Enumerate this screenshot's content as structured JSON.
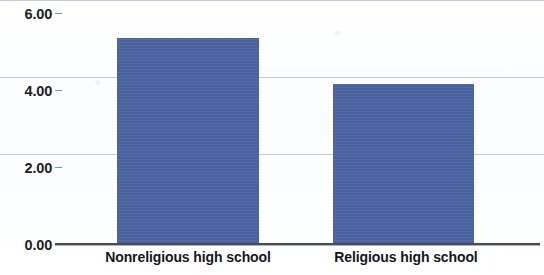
{
  "chart_data": {
    "type": "bar",
    "title": "",
    "subtitle": "",
    "xlabel": "",
    "ylabel": "",
    "categories": [
      "Nonreligious high school",
      "Religious high school"
    ],
    "values": [
      5.34,
      4.16
    ],
    "series": [
      {
        "name": "",
        "values": [
          5.34,
          4.16
        ]
      }
    ],
    "ylim": [
      0.0,
      6.0
    ],
    "yticks": [
      0.0,
      2.0,
      4.0,
      6.0
    ],
    "ytick_labels": [
      "0.00",
      "2.00",
      "4.00",
      "6.00"
    ],
    "grid": "horizontal",
    "legend": "none",
    "bar_color": "#4a63a0",
    "gridline_color": "#b9c4cf",
    "axis_color": "#4a4a52",
    "background_color": "#ffffff"
  },
  "axis": {
    "y": {
      "ticks": [
        {
          "label": "6.00",
          "value": 6.0
        },
        {
          "label": "4.00",
          "value": 4.0
        },
        {
          "label": "2.00",
          "value": 2.0
        },
        {
          "label": "0.00",
          "value": 0.0
        }
      ]
    },
    "x": {
      "ticks": [
        {
          "label": "Nonreligious high school"
        },
        {
          "label": "Religious high school"
        }
      ]
    }
  }
}
